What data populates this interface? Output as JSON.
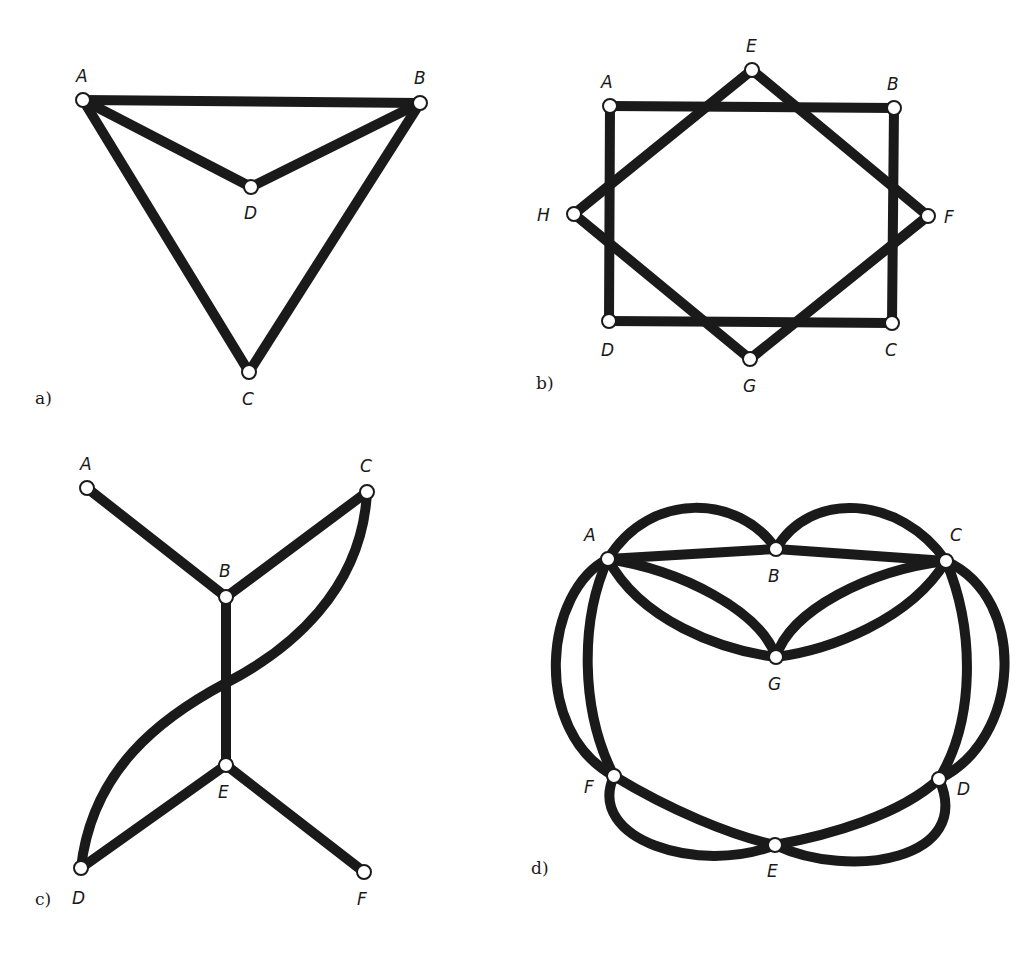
{
  "figure": {
    "colors": {
      "edge": "#1a1a1a",
      "node_fill": "#ffffff",
      "background": "#ffffff"
    },
    "panels": [
      {
        "id": "a",
        "label": "a)",
        "label_pos": [
          35,
          404
        ],
        "nodes": [
          {
            "id": "A",
            "x": 83,
            "y": 100,
            "lx": 76,
            "ly": 82
          },
          {
            "id": "B",
            "x": 420,
            "y": 103,
            "lx": 414,
            "ly": 84
          },
          {
            "id": "D",
            "x": 251,
            "y": 187,
            "lx": 244,
            "ly": 219
          },
          {
            "id": "C",
            "x": 249,
            "y": 372,
            "lx": 242,
            "ly": 405
          }
        ],
        "edges": [
          {
            "from": "A",
            "to": "B",
            "path": "M83,100 L420,103"
          },
          {
            "from": "A",
            "to": "D",
            "path": "M83,100 L251,187"
          },
          {
            "from": "D",
            "to": "B",
            "path": "M251,187 L420,103"
          },
          {
            "from": "A",
            "to": "C",
            "path": "M83,100 L249,372"
          },
          {
            "from": "B",
            "to": "C",
            "path": "M420,103 L249,372"
          }
        ]
      },
      {
        "id": "b",
        "label": "b)",
        "label_pos": [
          536,
          389
        ],
        "nodes": [
          {
            "id": "A",
            "x": 610,
            "y": 106,
            "lx": 601,
            "ly": 88
          },
          {
            "id": "B",
            "x": 894,
            "y": 108,
            "lx": 887,
            "ly": 90
          },
          {
            "id": "C",
            "x": 892,
            "y": 323,
            "lx": 885,
            "ly": 356
          },
          {
            "id": "D",
            "x": 609,
            "y": 321,
            "lx": 601,
            "ly": 356
          },
          {
            "id": "E",
            "x": 752,
            "y": 70,
            "lx": 746,
            "ly": 52
          },
          {
            "id": "F",
            "x": 928,
            "y": 216,
            "lx": 944,
            "ly": 223
          },
          {
            "id": "G",
            "x": 750,
            "y": 359,
            "lx": 743,
            "ly": 392
          },
          {
            "id": "H",
            "x": 574,
            "y": 214,
            "lx": 537,
            "ly": 221
          }
        ],
        "edges": [
          {
            "from": "A",
            "to": "B",
            "path": "M610,106 L894,108"
          },
          {
            "from": "B",
            "to": "C",
            "path": "M894,108 L892,323"
          },
          {
            "from": "C",
            "to": "D",
            "path": "M892,323 L609,321"
          },
          {
            "from": "D",
            "to": "A",
            "path": "M609,321 L610,106"
          },
          {
            "from": "E",
            "to": "F",
            "path": "M752,70 L928,216"
          },
          {
            "from": "F",
            "to": "G",
            "path": "M928,216 L750,359"
          },
          {
            "from": "G",
            "to": "H",
            "path": "M750,359 L574,214"
          },
          {
            "from": "H",
            "to": "E",
            "path": "M574,214 L752,70"
          }
        ]
      },
      {
        "id": "c",
        "label": "c)",
        "label_pos": [
          35,
          905
        ],
        "nodes": [
          {
            "id": "A",
            "x": 87,
            "y": 488,
            "lx": 80,
            "ly": 470
          },
          {
            "id": "B",
            "x": 226,
            "y": 597,
            "lx": 219,
            "ly": 577
          },
          {
            "id": "C",
            "x": 367,
            "y": 492,
            "lx": 360,
            "ly": 472
          },
          {
            "id": "E",
            "x": 226,
            "y": 765,
            "lx": 218,
            "ly": 798
          },
          {
            "id": "D",
            "x": 81,
            "y": 868,
            "lx": 72,
            "ly": 904
          },
          {
            "id": "F",
            "x": 364,
            "y": 872,
            "lx": 357,
            "ly": 905
          }
        ],
        "edges": [
          {
            "from": "A",
            "to": "B",
            "path": "M87,488 L226,597"
          },
          {
            "from": "B",
            "to": "C",
            "path": "M226,597 L367,492"
          },
          {
            "from": "B",
            "to": "E",
            "path": "M226,597 L226,765"
          },
          {
            "from": "E",
            "to": "D",
            "path": "M226,765 L81,868"
          },
          {
            "from": "E",
            "to": "F",
            "path": "M226,765 L364,872"
          },
          {
            "from": "C",
            "to": "D",
            "path": "M367,492 C362,590 290,650 226,683 C160,718 92,770 81,868"
          }
        ]
      },
      {
        "id": "d",
        "label": "d)",
        "label_pos": [
          531,
          874
        ],
        "nodes": [
          {
            "id": "A",
            "x": 608,
            "y": 559,
            "lx": 584,
            "ly": 541
          },
          {
            "id": "B",
            "x": 776,
            "y": 549,
            "lx": 768,
            "ly": 582
          },
          {
            "id": "C",
            "x": 946,
            "y": 561,
            "lx": 950,
            "ly": 541
          },
          {
            "id": "G",
            "x": 776,
            "y": 657,
            "lx": 768,
            "ly": 690
          },
          {
            "id": "F",
            "x": 614,
            "y": 776,
            "lx": 584,
            "ly": 793
          },
          {
            "id": "D",
            "x": 939,
            "y": 779,
            "lx": 957,
            "ly": 795
          },
          {
            "id": "E",
            "x": 775,
            "y": 845,
            "lx": 767,
            "ly": 877
          }
        ],
        "edges": [
          {
            "from": "A",
            "to": "B",
            "path": "M608,559 L776,549"
          },
          {
            "from": "B",
            "to": "C",
            "path": "M776,549 L946,561"
          },
          {
            "from": "A",
            "to": "B",
            "path": "M608,559 C650,490 740,495 776,549"
          },
          {
            "from": "B",
            "to": "C",
            "path": "M776,549 C810,490 900,495 946,561"
          },
          {
            "from": "A",
            "to": "G",
            "path": "M608,559 C680,570 760,610 776,657"
          },
          {
            "from": "A",
            "to": "G",
            "path": "M608,559 C640,620 720,650 776,657"
          },
          {
            "from": "C",
            "to": "G",
            "path": "M946,561 C870,570 790,610 776,657"
          },
          {
            "from": "C",
            "to": "G",
            "path": "M946,561 C910,620 830,650 776,657"
          },
          {
            "from": "A",
            "to": "F",
            "path": "M608,559 C545,590 530,730 614,776"
          },
          {
            "from": "A",
            "to": "F",
            "path": "M608,559 C580,620 580,710 614,776"
          },
          {
            "from": "C",
            "to": "D",
            "path": "M946,561 C1030,600 1020,740 939,779"
          },
          {
            "from": "C",
            "to": "D",
            "path": "M946,561 C975,630 975,720 939,779"
          },
          {
            "from": "F",
            "to": "E",
            "path": "M614,776 C670,810 730,835 775,845"
          },
          {
            "from": "F",
            "to": "E",
            "path": "M614,776 C585,840 700,875 775,845"
          },
          {
            "from": "E",
            "to": "D",
            "path": "M775,845 C830,835 900,815 939,779"
          },
          {
            "from": "E",
            "to": "D",
            "path": "M775,845 C850,880 975,860 939,779"
          }
        ]
      }
    ]
  }
}
